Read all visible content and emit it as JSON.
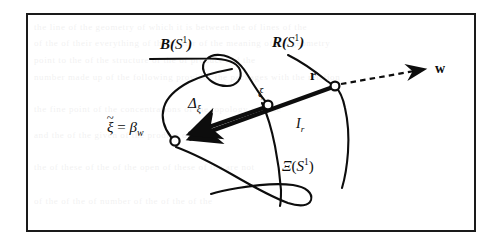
{
  "figure": {
    "frame": {
      "border_color": "#1a1a1a",
      "background": "#ffffff"
    },
    "ink_color": "#0d0d0d"
  },
  "labels": {
    "curve_b": {
      "name": "B",
      "arg_open": "(",
      "set": "S",
      "exp": "1",
      "arg_close": ")"
    },
    "curve_r": {
      "name": "R",
      "arg_open": "(",
      "set": "S",
      "exp": "1",
      "arg_close": ")"
    },
    "curve_xi_big": {
      "name": "Ξ",
      "arg_open": "(",
      "set": "S",
      "exp": "1",
      "arg_close": ")"
    },
    "node_r": "r",
    "vector_w": "w",
    "segment_ir": {
      "base": "I",
      "sub": "r"
    },
    "segment_delta": {
      "base": "Δ",
      "sub": "ξ"
    },
    "node_xi": "ξ",
    "node_beta": {
      "xi": "ξ",
      "tilde": "~",
      "equals": "=",
      "beta": "β",
      "beta_sub": "w"
    }
  },
  "nodes": [
    {
      "id": "beta",
      "label": "xi-tilde-equals-beta-w",
      "x": 175,
      "y": 141
    },
    {
      "id": "xi",
      "label": "xi",
      "x": 268,
      "y": 105
    },
    {
      "id": "r",
      "label": "r",
      "x": 335,
      "y": 86
    }
  ],
  "ghost_text": {
    "lines": [
      "the line of the geometry of which it is between the of lines of the",
      "of the of their everything of the matter of the meaning of the geometry",
      "point to the of the structure of the of product and the",
      "number made up of the following provides the packages with the relation",
      "the fine point of the concentrations of the topology and the",
      "and the of the given of the product of",
      "the of these of the of the open of these of the are not",
      "of the of the of number of the of the of the"
    ]
  }
}
